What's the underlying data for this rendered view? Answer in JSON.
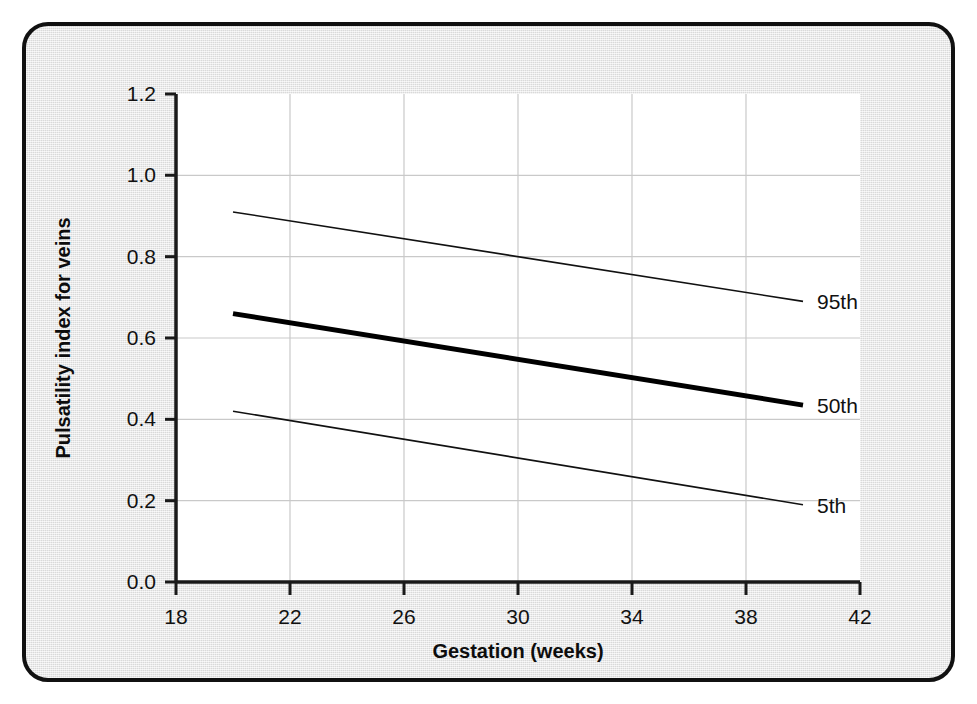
{
  "chart_data": {
    "type": "line",
    "title": "",
    "xlabel": "Gestation (weeks)",
    "ylabel": "Pulsatility index for veins",
    "xlim": [
      18,
      42
    ],
    "ylim": [
      0.0,
      1.2
    ],
    "xticks": [
      "18",
      "22",
      "26",
      "30",
      "34",
      "38",
      "42"
    ],
    "xtick_values": [
      18,
      22,
      26,
      30,
      34,
      38,
      42
    ],
    "yticks": [
      "0.0",
      "0.2",
      "0.4",
      "0.6",
      "0.8",
      "1.0",
      "1.2"
    ],
    "ytick_values": [
      0.0,
      0.2,
      0.4,
      0.6,
      0.8,
      1.0,
      1.2
    ],
    "grid": true,
    "legend_position": "right-inline-end-of-line",
    "x": [
      20,
      40
    ],
    "series": [
      {
        "name": "95th",
        "label": "95th",
        "values": [
          0.91,
          0.69
        ],
        "emphasis": "normal",
        "line_width": 1.6,
        "color": "#111111"
      },
      {
        "name": "50th",
        "label": "50th",
        "values": [
          0.66,
          0.435
        ],
        "emphasis": "bold",
        "line_width": 5.0,
        "color": "#000000"
      },
      {
        "name": "5th",
        "label": "5th",
        "values": [
          0.42,
          0.19
        ],
        "emphasis": "normal",
        "line_width": 1.6,
        "color": "#111111"
      }
    ],
    "colors": {
      "plot_background": "#ffffff",
      "card_background": "#e8e8e8",
      "axis": "#1a1a1a",
      "grid": "#c9c9c9",
      "text": "#111111"
    }
  }
}
